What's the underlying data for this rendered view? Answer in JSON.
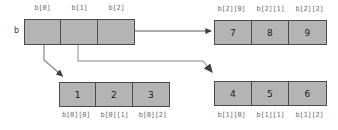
{
  "diagram": {
    "variable_label": "b",
    "colors": {
      "cell_fill": "#b4b4b4",
      "cell_border": "#4a4a4a",
      "label_text": "#6e6e6e",
      "value_text": "#1a1a1a",
      "arrow": "#3f3f3f",
      "background": "#ffffff"
    },
    "pointer_array": {
      "name": "b",
      "cell_labels": [
        "b[0]",
        "b[1]",
        "b[2]"
      ],
      "cell_values": [
        "",
        "",
        ""
      ]
    },
    "row_arrays": [
      {
        "id": "b2",
        "position": "top-right",
        "cell_labels": [
          "b[2][0]",
          "b[2][1]",
          "b[2][2]"
        ],
        "cell_values": [
          "7",
          "8",
          "9"
        ]
      },
      {
        "id": "b0",
        "position": "bottom-left",
        "cell_labels": [
          "b[0][0]",
          "b[0][1]",
          "b[0][2]"
        ],
        "cell_values": [
          "1",
          "2",
          "3"
        ]
      },
      {
        "id": "b1",
        "position": "bottom-right",
        "cell_labels": [
          "b[1][0]",
          "b[1][1]",
          "b[1][2]"
        ],
        "cell_values": [
          "4",
          "5",
          "6"
        ]
      }
    ],
    "arrows": [
      {
        "name": "arrow-b0-to-row0",
        "from": "b[0]",
        "to": "b[0][0] row"
      },
      {
        "name": "arrow-b1-to-row1",
        "from": "b[1]",
        "to": "b[1][0] row"
      },
      {
        "name": "arrow-b2-to-row2",
        "from": "b[2]",
        "to": "b[2][0] row"
      }
    ]
  }
}
